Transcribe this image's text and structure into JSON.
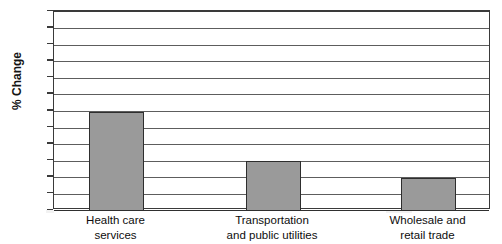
{
  "chart_data": {
    "type": "bar",
    "title": "",
    "xlabel": "",
    "ylabel": "% Change",
    "categories": [
      "Health care services",
      "Transportation and public utilities",
      "Wholesale and retail trade"
    ],
    "category_lines": [
      [
        "Health care",
        "services"
      ],
      [
        "Transportation",
        "and public utilities"
      ],
      [
        "Wholesale and",
        "retail trade"
      ]
    ],
    "values": [
      30,
      15,
      10
    ],
    "ylim": [
      0,
      60
    ],
    "ytick_step": 5,
    "ytick_labels": [
      "60",
      "55",
      "50",
      "45",
      "40",
      "35",
      "30",
      "25",
      "20",
      "15",
      "10",
      "5",
      "0"
    ],
    "grid": true,
    "legend": "none",
    "bar_color": "#9a9a9a",
    "bar_border_color": "#2e2e2e",
    "gridline_color": "#5d5d5d",
    "axis_color": "#3a3a3a",
    "background": "#ffffff"
  },
  "axes": {
    "y_title": "% Change"
  }
}
